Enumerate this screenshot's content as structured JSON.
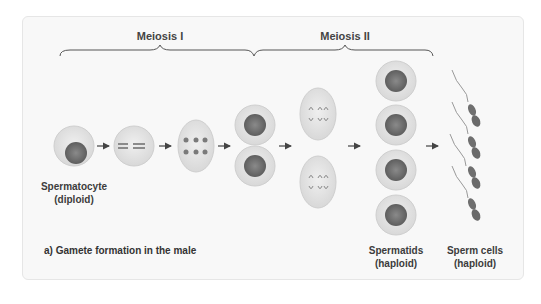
{
  "diagram": {
    "stages": [
      {
        "title": "Meiosis I"
      },
      {
        "title": "Meiosis II"
      }
    ],
    "labels": {
      "spermatocyte": {
        "name": "Spermatocyte",
        "ploidy": "(diploid)"
      },
      "spermatids": {
        "name": "Spermatids",
        "ploidy": "(haploid)"
      },
      "sperm_cells": {
        "name": "Sperm cells",
        "ploidy": "(haploid)"
      }
    },
    "caption": "a) Gamete formation in the male",
    "colors": {
      "panel_bg": "#f8f8f8",
      "cell_fill": "#e4e4e4",
      "cell_edge": "#cfcfcf",
      "nucleus": "#6e6e6e",
      "chromosome": "#7a7a7a",
      "text": "#3c3c3c"
    },
    "counts": {
      "spermatids": 4,
      "sperm_cells": 4
    }
  }
}
